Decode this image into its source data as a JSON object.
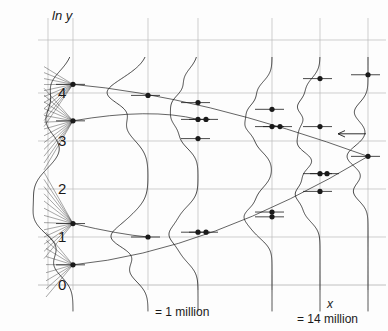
{
  "figure": {
    "kind": "scientific-scatter-distribution-figure",
    "background": "#fdfdfd",
    "ink_color": "#1a1a1a",
    "grid_color": "#b9b9b9",
    "axis_label_y": "ln y",
    "axis_label_x": "x",
    "caption_left": "= 1 million",
    "caption_right": "= 14 million"
  },
  "chart_data": {
    "type": "scatter",
    "title": "",
    "xlabel": "x",
    "ylabel": "ln y",
    "grid": true,
    "legend": null,
    "x_tick_labels": [
      "= 1 million",
      "= 14 million"
    ],
    "x_tick_positions": [
      148,
      320
    ],
    "y_tick_labels": [
      "0",
      "1",
      "2",
      "3",
      "4"
    ],
    "y_tick_values": [
      0,
      1,
      2,
      3,
      4
    ],
    "y_tick_pixels": [
      285,
      237,
      189,
      141,
      93
    ],
    "ylim": [
      -0.4,
      4.6
    ],
    "xlim": [
      0,
      388
    ],
    "stations": [
      {
        "name": "station-1",
        "x_px": 73,
        "curve_scale": 36,
        "direction": "left",
        "modes": [
          4.18,
          3.42,
          2.05,
          1.28,
          0.42
        ],
        "weights": [
          0.55,
          0.72,
          1.0,
          0.78,
          0.5
        ],
        "widths": [
          0.3,
          0.34,
          0.45,
          0.34,
          0.26
        ],
        "points": [
          4.18,
          3.42,
          2.05,
          1.28,
          0.42
        ]
      },
      {
        "name": "station-2",
        "x_px": 148,
        "curve_scale": 30,
        "direction": "left",
        "modes": [
          4.25,
          3.95,
          3.3,
          1.3,
          0.95,
          0.3
        ],
        "weights": [
          0.62,
          0.95,
          0.7,
          0.58,
          0.92,
          0.6
        ],
        "widths": [
          0.26,
          0.22,
          0.3,
          0.28,
          0.22,
          0.24
        ],
        "points": [
          3.95,
          1.0
        ]
      },
      {
        "name": "station-3",
        "x_px": 198,
        "curve_scale": 26,
        "direction": "left",
        "modes": [
          4.3,
          3.8,
          3.45,
          3.05,
          1.45,
          1.05,
          0.65
        ],
        "weights": [
          0.5,
          0.86,
          0.72,
          0.62,
          0.58,
          0.9,
          0.55
        ],
        "widths": [
          0.22,
          0.2,
          0.18,
          0.22,
          0.22,
          0.2,
          0.22
        ],
        "points": [
          3.8,
          3.45,
          3.05,
          1.1,
          0.98
        ]
      },
      {
        "name": "station-4",
        "x_px": 272,
        "curve_scale": 24,
        "direction": "left",
        "modes": [
          4.05,
          3.62,
          3.3,
          2.95,
          1.85,
          1.45,
          1.12
        ],
        "weights": [
          0.56,
          0.88,
          0.8,
          0.6,
          0.55,
          0.92,
          0.62
        ],
        "widths": [
          0.2,
          0.18,
          0.16,
          0.2,
          0.2,
          0.18,
          0.2
        ],
        "points": [
          3.66,
          3.3,
          3.26,
          1.52,
          1.42
        ]
      },
      {
        "name": "station-5",
        "x_px": 320,
        "curve_scale": 24,
        "direction": "left",
        "modes": [
          4.12,
          3.7,
          3.25,
          2.9,
          2.3,
          1.9,
          1.5
        ],
        "weights": [
          0.52,
          0.85,
          0.7,
          0.8,
          0.62,
          0.9,
          0.58
        ],
        "widths": [
          0.2,
          0.18,
          0.18,
          0.18,
          0.18,
          0.18,
          0.2
        ],
        "points": [
          4.3,
          3.3,
          2.32,
          1.95,
          1.9
        ]
      },
      {
        "name": "station-6",
        "x_px": 368,
        "curve_scale": 22,
        "direction": "left",
        "modes": [
          3.6,
          2.68,
          1.95
        ],
        "weights": [
          0.62,
          0.95,
          0.66
        ],
        "widths": [
          0.2,
          0.22,
          0.2
        ],
        "points": [
          4.38,
          2.68
        ]
      }
    ],
    "marker_points": [
      {
        "x_px": 73,
        "y_val": 4.18
      },
      {
        "x_px": 73,
        "y_val": 3.42
      },
      {
        "x_px": 73,
        "y_val": 1.28
      },
      {
        "x_px": 73,
        "y_val": 0.42
      },
      {
        "x_px": 148,
        "y_val": 3.95
      },
      {
        "x_px": 148,
        "y_val": 1.0
      },
      {
        "x_px": 198,
        "y_val": 3.8
      },
      {
        "x_px": 198,
        "y_val": 3.45
      },
      {
        "x_px": 198,
        "y_val": 3.05
      },
      {
        "x_px": 198,
        "y_val": 1.1
      },
      {
        "x_px": 206,
        "y_val": 3.45
      },
      {
        "x_px": 206,
        "y_val": 1.1
      },
      {
        "x_px": 272,
        "y_val": 3.66
      },
      {
        "x_px": 272,
        "y_val": 3.3
      },
      {
        "x_px": 280,
        "y_val": 3.3
      },
      {
        "x_px": 272,
        "y_val": 1.52
      },
      {
        "x_px": 272,
        "y_val": 1.42
      },
      {
        "x_px": 320,
        "y_val": 4.3
      },
      {
        "x_px": 320,
        "y_val": 3.3
      },
      {
        "x_px": 320,
        "y_val": 2.32
      },
      {
        "x_px": 327,
        "y_val": 2.32
      },
      {
        "x_px": 320,
        "y_val": 1.95
      },
      {
        "x_px": 368,
        "y_val": 4.38
      },
      {
        "x_px": 368,
        "y_val": 2.68
      }
    ],
    "connector_arcs": [
      {
        "name": "upper-branch",
        "from": [
          73,
          4.18
        ],
        "ctrl": [
          200,
          3.95
        ],
        "to": [
          368,
          2.68
        ]
      },
      {
        "name": "lower-branch",
        "from": [
          73,
          0.42
        ],
        "ctrl": [
          210,
          0.7
        ],
        "to": [
          368,
          2.68
        ]
      },
      {
        "name": "mid-branch-a",
        "from": [
          73,
          3.42
        ],
        "ctrl": [
          150,
          3.7
        ],
        "to": [
          198,
          3.45
        ]
      },
      {
        "name": "mid-branch-b",
        "from": [
          73,
          1.28
        ],
        "ctrl": [
          120,
          1.05
        ],
        "to": [
          148,
          1.0
        ]
      }
    ],
    "gridlines_h": [
      40,
      93,
      141,
      189,
      237,
      285
    ],
    "gridlines_v": [
      48,
      73,
      148,
      198,
      272,
      320,
      368
    ],
    "annotations": [
      {
        "name": "left-arrow-marker",
        "x_px": 366,
        "y_val": 3.15,
        "text": "←"
      }
    ]
  }
}
